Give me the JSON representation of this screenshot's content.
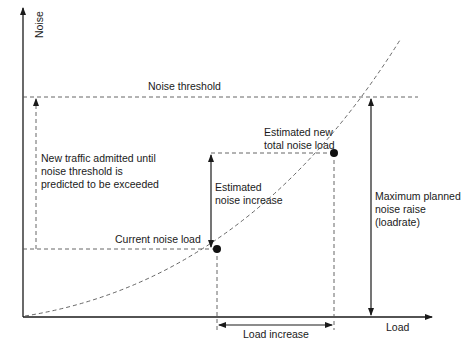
{
  "diagram": {
    "axes": {
      "y_label": "Noise",
      "x_label": "Load"
    },
    "labels": {
      "noise_threshold": "Noise threshold",
      "new_traffic": "New traffic admitted until\nnoise threshold is\npredicted to be exceeded",
      "estimated_new_total": "Estimated new\ntotal noise load",
      "estimated_increase": "Estimated\nnoise increase",
      "current_noise_load": "Current noise load",
      "max_planned": "Maximum planned\nnoise raise\n(loadrate)",
      "load_increase": "Load increase"
    },
    "points": {
      "current_noise_load": {
        "x": 217,
        "y": 249
      },
      "estimated_new_total": {
        "x": 334,
        "y": 153
      }
    },
    "colors": {
      "line": "#1a1a1a",
      "dashed": "#555555"
    }
  }
}
